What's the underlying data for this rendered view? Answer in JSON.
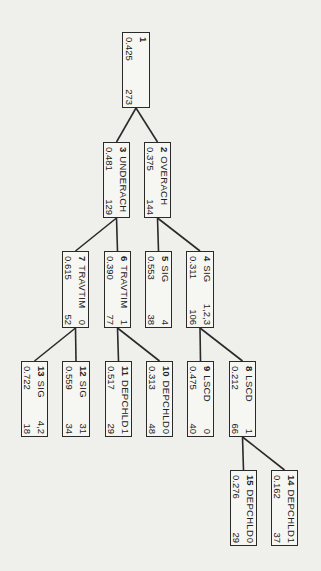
{
  "diagram": {
    "type": "decision-tree",
    "orientation": "rotated-90-clockwise",
    "colors": {
      "background": "#efefec",
      "box_fill": "#f6f6f3",
      "line": "#2a2a2a",
      "text": "#222222"
    }
  },
  "nodes": [
    {
      "id": "1",
      "split_var": "",
      "split_value": "",
      "proportion": "0.425",
      "n": "273",
      "parent": null
    },
    {
      "id": "2",
      "split_var": "OVERACH",
      "split_value": "",
      "proportion": "0.375",
      "n": "144",
      "parent": "1"
    },
    {
      "id": "3",
      "split_var": "UNDERACH",
      "split_value": "",
      "proportion": "0.481",
      "n": "129",
      "parent": "1"
    },
    {
      "id": "4",
      "split_var": "SIG",
      "split_value": "1,2,3",
      "proportion": "0.311",
      "n": "106",
      "parent": "2"
    },
    {
      "id": "5",
      "split_var": "SIG",
      "split_value": "4",
      "proportion": "0.553",
      "n": "38",
      "parent": "2"
    },
    {
      "id": "6",
      "split_var": "TRAVTIM",
      "split_value": "1",
      "proportion": "0.390",
      "n": "77",
      "parent": "3"
    },
    {
      "id": "7",
      "split_var": "TRAVTIM",
      "split_value": "0",
      "proportion": "0.615",
      "n": "52",
      "parent": "3"
    },
    {
      "id": "8",
      "split_var": "LSCD",
      "split_value": "1",
      "proportion": "0.212",
      "n": "66",
      "parent": "4"
    },
    {
      "id": "9",
      "split_var": "LSCD",
      "split_value": "0",
      "proportion": "0.475",
      "n": "40",
      "parent": "4"
    },
    {
      "id": "10",
      "split_var": "DEPCHLD",
      "split_value": "0",
      "proportion": "0.313",
      "n": "48",
      "parent": "6"
    },
    {
      "id": "11",
      "split_var": "DEPCHLD",
      "split_value": "1",
      "proportion": "0.517",
      "n": "29",
      "parent": "6"
    },
    {
      "id": "12",
      "split_var": "SIG",
      "split_value": "31",
      "proportion": "0.559",
      "n": "34",
      "parent": "7"
    },
    {
      "id": "13",
      "split_var": "SIG",
      "split_value": "4,2",
      "proportion": "0.722",
      "n": "18",
      "parent": "7"
    },
    {
      "id": "14",
      "split_var": "DEPCHLD",
      "split_value": "1",
      "proportion": "0.162",
      "n": "37",
      "parent": "8"
    },
    {
      "id": "15",
      "split_var": "DEPCHLD",
      "split_value": "0",
      "proportion": "0.276",
      "n": "29",
      "parent": "8"
    }
  ]
}
